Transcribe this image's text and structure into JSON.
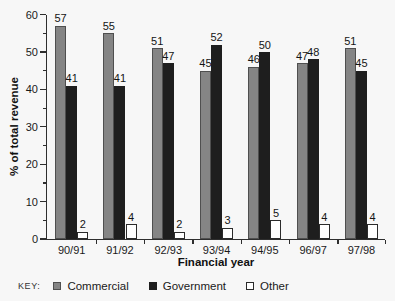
{
  "chart_data": {
    "type": "bar",
    "title": "",
    "xlabel": "Financial year",
    "ylabel": "% of total revenue",
    "categories": [
      "90/91",
      "91/92",
      "92/93",
      "93/94",
      "94/95",
      "96/97",
      "97/98"
    ],
    "series": [
      {
        "name": "Commercial",
        "color": "#858585",
        "border": "#4f4f4f",
        "values": [
          57,
          55,
          51,
          45,
          46,
          47,
          51
        ]
      },
      {
        "name": "Government",
        "color": "#1e1e1e",
        "border": "",
        "values": [
          41,
          41,
          47,
          52,
          50,
          48,
          45
        ]
      },
      {
        "name": "Other",
        "color": "#ffffff",
        "border": "#2b2b2b",
        "values": [
          2,
          4,
          2,
          3,
          5,
          4,
          4
        ]
      }
    ],
    "ylim": [
      0,
      60
    ],
    "y_major_ticks": [
      0,
      10,
      20,
      30,
      40,
      50,
      60
    ],
    "y_minor_step": 5,
    "grid": false,
    "legend_position": "bottom",
    "bar_value_labels_shown": true
  },
  "legend": {
    "key_label": "KEY:",
    "items": [
      {
        "label": "Commercial",
        "color": "#858585",
        "border": "#4f4f4f"
      },
      {
        "label": "Government",
        "color": "#1e1e1e",
        "border": ""
      },
      {
        "label": "Other",
        "color": "#ffffff",
        "border": "#2b2b2b"
      }
    ]
  }
}
